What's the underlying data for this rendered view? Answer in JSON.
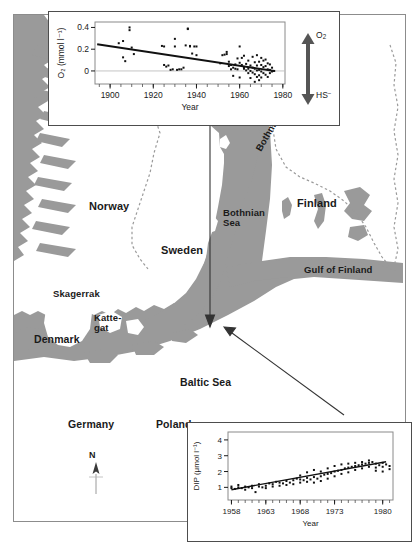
{
  "figure": {
    "map": {
      "labels": [
        {
          "name": "norway",
          "text": "Norway"
        },
        {
          "name": "sweden",
          "text": "Sweden"
        },
        {
          "name": "finland",
          "text": "Finland"
        },
        {
          "name": "bothnian-sea",
          "text": "Bothnian\nSea"
        },
        {
          "name": "bothnian-bay",
          "text": "Bothnian Bay"
        },
        {
          "name": "gulf-of-finland",
          "text": "Gulf of Finland"
        },
        {
          "name": "skagerrak",
          "text": "Skagerrak"
        },
        {
          "name": "kattegat",
          "text": "Katte-\ngat"
        },
        {
          "name": "denmark",
          "text": "Denmark"
        },
        {
          "name": "germany",
          "text": "Germany"
        },
        {
          "name": "poland",
          "text": "Poland"
        },
        {
          "name": "baltic-sea",
          "text": "Baltic Sea"
        }
      ],
      "compass_label": "N",
      "land_color": "#9a9a9a",
      "sea_color": "#ffffff",
      "border_color": "#8c8c8c"
    },
    "legend_arrow": {
      "top_label": "O₂",
      "bottom_label": "HS⁻"
    }
  },
  "chart_data": [
    {
      "name": "oxygen-trend-chart",
      "type": "scatter",
      "title": "",
      "xlabel": "Year",
      "ylabel": "O₂ (mmol l⁻¹)",
      "xlim": [
        1893,
        1981
      ],
      "ylim": [
        -0.12,
        0.45
      ],
      "xticks": [
        1900,
        1920,
        1940,
        1960,
        1980
      ],
      "yticks": [
        0,
        0.2,
        0.4
      ],
      "ytick_labels": [
        "0",
        "0.2",
        "0.4"
      ],
      "grid": false,
      "zero_line": true,
      "trend": {
        "x": [
          1894,
          1976
        ],
        "y": [
          0.245,
          0.0
        ]
      },
      "points": [
        [
          1904,
          0.255
        ],
        [
          1906,
          0.275
        ],
        [
          1906,
          0.125
        ],
        [
          1907,
          0.09
        ],
        [
          1909,
          0.4
        ],
        [
          1909,
          0.375
        ],
        [
          1910,
          0.215
        ],
        [
          1911,
          0.155
        ],
        [
          1924,
          0.23
        ],
        [
          1925,
          0.225
        ],
        [
          1925,
          0.055
        ],
        [
          1926,
          0.04
        ],
        [
          1927,
          0.05
        ],
        [
          1928,
          0.01
        ],
        [
          1929,
          0.015
        ],
        [
          1930,
          0.225
        ],
        [
          1930,
          0.295
        ],
        [
          1931,
          0.01
        ],
        [
          1932,
          0.015
        ],
        [
          1933,
          0.015
        ],
        [
          1934,
          0.03
        ],
        [
          1935,
          0.235
        ],
        [
          1936,
          0.39
        ],
        [
          1936,
          0.385
        ],
        [
          1937,
          0.225
        ],
        [
          1937,
          0.23
        ],
        [
          1938,
          0.16
        ],
        [
          1939,
          0.225
        ],
        [
          1940,
          0.225
        ],
        [
          1940,
          0.145
        ],
        [
          1951,
          0.07
        ],
        [
          1952,
          0.145
        ],
        [
          1953,
          0.15
        ],
        [
          1954,
          0.175
        ],
        [
          1954,
          0.155
        ],
        [
          1955,
          0.085
        ],
        [
          1955,
          0.045
        ],
        [
          1956,
          0.055
        ],
        [
          1956,
          0.015
        ],
        [
          1957,
          0.03
        ],
        [
          1957,
          -0.045
        ],
        [
          1958,
          0.02
        ],
        [
          1958,
          0.06
        ],
        [
          1959,
          0.015
        ],
        [
          1959,
          0.115
        ],
        [
          1960,
          0.225
        ],
        [
          1960,
          0.075
        ],
        [
          1960,
          -0.06
        ],
        [
          1961,
          0.12
        ],
        [
          1961,
          0.055
        ],
        [
          1962,
          0.14
        ],
        [
          1962,
          0.035
        ],
        [
          1962,
          0.02
        ],
        [
          1963,
          0.065
        ],
        [
          1963,
          0.005
        ],
        [
          1964,
          0.095
        ],
        [
          1964,
          0.02
        ],
        [
          1964,
          -0.02
        ],
        [
          1965,
          0.05
        ],
        [
          1965,
          0.0
        ],
        [
          1965,
          -0.065
        ],
        [
          1966,
          0.13
        ],
        [
          1966,
          0.03
        ],
        [
          1966,
          -0.015
        ],
        [
          1967,
          0.08
        ],
        [
          1967,
          0.02
        ],
        [
          1967,
          -0.03
        ],
        [
          1967,
          -0.1
        ],
        [
          1968,
          0.145
        ],
        [
          1968,
          0.05
        ],
        [
          1968,
          0.005
        ],
        [
          1968,
          -0.055
        ],
        [
          1969,
          0.085
        ],
        [
          1969,
          0.01
        ],
        [
          1969,
          -0.04
        ],
        [
          1969,
          -0.085
        ],
        [
          1970,
          0.12
        ],
        [
          1970,
          0.055
        ],
        [
          1970,
          -0.005
        ],
        [
          1970,
          -0.06
        ],
        [
          1971,
          0.095
        ],
        [
          1971,
          0.035
        ],
        [
          1971,
          -0.02
        ],
        [
          1972,
          0.105
        ],
        [
          1972,
          0.045
        ],
        [
          1972,
          -0.035
        ],
        [
          1973,
          0.07
        ],
        [
          1973,
          0.015
        ],
        [
          1973,
          -0.055
        ],
        [
          1974,
          0.06
        ],
        [
          1974,
          0.01
        ],
        [
          1974,
          -0.02
        ],
        [
          1975,
          0.03
        ],
        [
          1975,
          -0.005
        ],
        [
          1976,
          0.0
        ]
      ]
    },
    {
      "name": "dip-trend-chart",
      "type": "scatter",
      "title": "",
      "xlabel": "Year",
      "ylabel": "DIP (μmol l⁻¹)",
      "xlim": [
        1957.5,
        1981.5
      ],
      "ylim": [
        0.2,
        4.5
      ],
      "xticks": [
        1958,
        1963,
        1968,
        1973,
        1980
      ],
      "yticks": [
        1,
        2,
        3,
        4
      ],
      "ytick_labels": [
        "1",
        "2",
        "3",
        "4"
      ],
      "grid": false,
      "trend": {
        "x": [
          1958,
          1980.5
        ],
        "y": [
          0.85,
          2.62
        ]
      },
      "points": [
        [
          1958,
          0.95
        ],
        [
          1958,
          1.05
        ],
        [
          1958.5,
          0.9
        ],
        [
          1959,
          1.0
        ],
        [
          1959,
          1.15
        ],
        [
          1959.5,
          0.95
        ],
        [
          1960,
          1.05
        ],
        [
          1960,
          0.85
        ],
        [
          1960.5,
          1.0
        ],
        [
          1961,
          1.1
        ],
        [
          1961,
          0.95
        ],
        [
          1961.5,
          0.7
        ],
        [
          1962,
          1.05
        ],
        [
          1962,
          1.2
        ],
        [
          1962.5,
          1.0
        ],
        [
          1963,
          1.1
        ],
        [
          1963,
          0.95
        ],
        [
          1963.5,
          1.25
        ],
        [
          1964,
          1.2
        ],
        [
          1964,
          1.05
        ],
        [
          1964.5,
          1.35
        ],
        [
          1965,
          1.3
        ],
        [
          1965,
          1.1
        ],
        [
          1965.5,
          1.25
        ],
        [
          1966,
          1.4
        ],
        [
          1966,
          1.15
        ],
        [
          1966.5,
          1.3
        ],
        [
          1967,
          1.45
        ],
        [
          1967,
          1.2
        ],
        [
          1967.5,
          1.55
        ],
        [
          1968,
          1.5
        ],
        [
          1968,
          1.3
        ],
        [
          1968,
          1.75
        ],
        [
          1968.5,
          1.45
        ],
        [
          1969,
          1.6
        ],
        [
          1969,
          1.35
        ],
        [
          1969,
          1.95
        ],
        [
          1969.5,
          1.5
        ],
        [
          1970,
          1.65
        ],
        [
          1970,
          1.3
        ],
        [
          1970,
          2.1
        ],
        [
          1970.5,
          1.55
        ],
        [
          1971,
          1.7
        ],
        [
          1971,
          1.4
        ],
        [
          1971,
          2.0
        ],
        [
          1971.5,
          1.8
        ],
        [
          1972,
          1.85
        ],
        [
          1972,
          1.55
        ],
        [
          1972,
          2.2
        ],
        [
          1972.5,
          1.9
        ],
        [
          1973,
          2.0
        ],
        [
          1973,
          1.7
        ],
        [
          1973,
          2.35
        ],
        [
          1973.5,
          2.05
        ],
        [
          1974,
          2.1
        ],
        [
          1974,
          1.85
        ],
        [
          1974,
          2.45
        ],
        [
          1974.5,
          2.2
        ],
        [
          1975,
          2.25
        ],
        [
          1975,
          1.95
        ],
        [
          1975,
          2.5
        ],
        [
          1975.5,
          2.3
        ],
        [
          1976,
          2.35
        ],
        [
          1976,
          2.1
        ],
        [
          1976,
          2.55
        ],
        [
          1976.5,
          2.4
        ],
        [
          1977,
          2.45
        ],
        [
          1977,
          2.2
        ],
        [
          1977,
          2.6
        ],
        [
          1977.5,
          2.5
        ],
        [
          1978,
          2.55
        ],
        [
          1978,
          2.3
        ],
        [
          1978,
          2.7
        ],
        [
          1978.5,
          2.6
        ],
        [
          1979,
          2.5
        ],
        [
          1979,
          2.25
        ],
        [
          1979,
          2.05
        ],
        [
          1979.5,
          2.4
        ],
        [
          1980,
          2.55
        ],
        [
          1980,
          2.3
        ],
        [
          1980,
          2.0
        ],
        [
          1980.5,
          2.45
        ],
        [
          1981,
          2.35
        ],
        [
          1981,
          2.15
        ]
      ]
    }
  ]
}
